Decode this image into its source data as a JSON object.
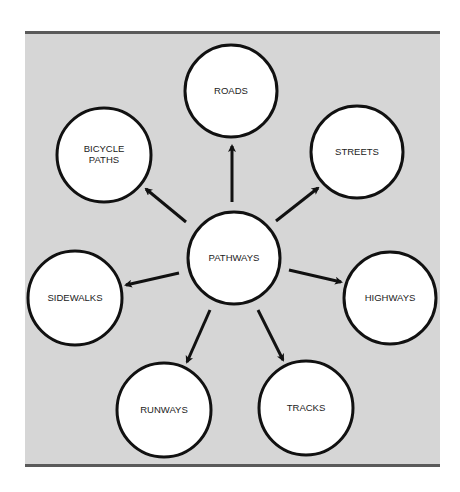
{
  "diagram": {
    "type": "hub-and-spoke",
    "colors": {
      "background": "#d6d6d6",
      "border": "#5a5a5a",
      "node_fill": "#ffffff",
      "node_stroke": "#111111",
      "arrow": "#111111",
      "text": "#222222"
    },
    "center": {
      "label": "PATHWAYS",
      "cx": 234,
      "cy": 258,
      "r": 46
    },
    "nodes": [
      {
        "id": "roads",
        "label_lines": [
          "ROADS"
        ],
        "cx": 231,
        "cy": 91,
        "r": 46,
        "arrow": {
          "x1": 232,
          "y1": 202,
          "x2": 232,
          "y2": 146
        }
      },
      {
        "id": "streets",
        "label_lines": [
          "STREETS"
        ],
        "cx": 357,
        "cy": 152,
        "r": 46,
        "arrow": {
          "x1": 276,
          "y1": 221,
          "x2": 318,
          "y2": 188
        }
      },
      {
        "id": "highways",
        "label_lines": [
          "HIGHWAYS"
        ],
        "cx": 390,
        "cy": 298,
        "r": 46,
        "arrow": {
          "x1": 289,
          "y1": 270,
          "x2": 341,
          "y2": 282
        }
      },
      {
        "id": "tracks",
        "label_lines": [
          "TRACKS"
        ],
        "cx": 306,
        "cy": 408,
        "r": 47,
        "arrow": {
          "x1": 258,
          "y1": 310,
          "x2": 283,
          "y2": 360
        }
      },
      {
        "id": "runways",
        "label_lines": [
          "RUNWAYS"
        ],
        "cx": 164,
        "cy": 410,
        "r": 47,
        "arrow": {
          "x1": 210,
          "y1": 310,
          "x2": 187,
          "y2": 362
        }
      },
      {
        "id": "sidewalks",
        "label_lines": [
          "SIDEWALKS"
        ],
        "cx": 75,
        "cy": 298,
        "r": 47,
        "arrow": {
          "x1": 179,
          "y1": 273,
          "x2": 126,
          "y2": 285
        }
      },
      {
        "id": "bicycle-paths",
        "label_lines": [
          "BICYCLE",
          "PATHS"
        ],
        "cx": 104,
        "cy": 155,
        "r": 47,
        "arrow": {
          "x1": 186,
          "y1": 222,
          "x2": 146,
          "y2": 189
        }
      }
    ]
  }
}
